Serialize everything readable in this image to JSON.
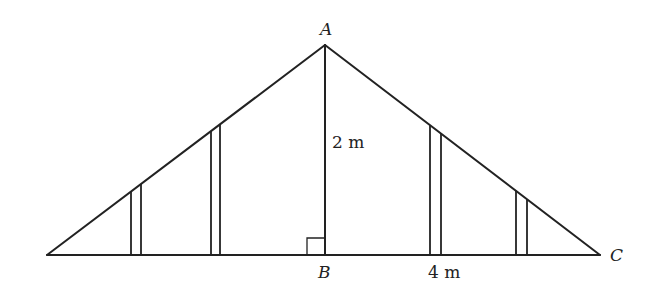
{
  "diagram": {
    "type": "roof truss / triangle cross-section",
    "stroke_color": "#222222",
    "background": "#ffffff",
    "points": {
      "A": {
        "label": "A",
        "x": 325,
        "y": 45
      },
      "B": {
        "label": "B",
        "x": 325,
        "y": 255
      },
      "C": {
        "label": "C",
        "x": 600,
        "y": 255
      },
      "L": {
        "label": "",
        "x": 47,
        "y": 255
      }
    },
    "labels": {
      "apex": "A",
      "foot": "B",
      "right_vertex": "C",
      "height": "2 m",
      "half_base": "4 m"
    },
    "measurements": [
      {
        "segment": "AB",
        "value": "2 m"
      },
      {
        "segment": "BC",
        "value": "4 m"
      }
    ],
    "right_angle_at": "B",
    "struts": [
      {
        "x1": 131,
        "x2": 141
      },
      {
        "x1": 211,
        "x2": 220
      },
      {
        "x1": 430,
        "x2": 441
      },
      {
        "x1": 516,
        "x2": 527
      }
    ]
  }
}
